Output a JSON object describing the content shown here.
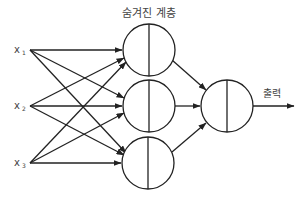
{
  "diagram": {
    "type": "neural-network",
    "hidden_layer_label": "숨겨진 계층",
    "output_label": "출력",
    "inputs": [
      {
        "name": "x",
        "subscript": "1"
      },
      {
        "name": "x",
        "subscript": "2"
      },
      {
        "name": "x",
        "subscript": "3"
      }
    ],
    "hidden_nodes": 3,
    "output_nodes": 1,
    "stroke_color": "#222222"
  }
}
